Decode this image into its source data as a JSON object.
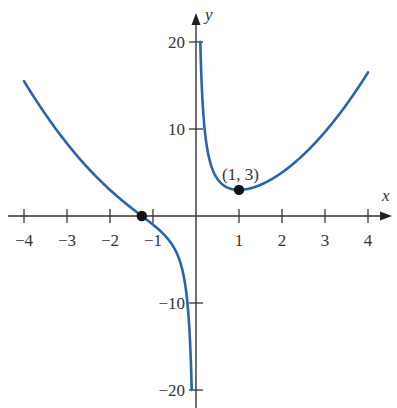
{
  "chart_data": {
    "type": "line",
    "title": "",
    "xlabel": "x",
    "ylabel": "y",
    "xlim": [
      -4,
      4
    ],
    "ylim": [
      -20,
      20
    ],
    "grid": false,
    "x_ticks": [
      -4,
      -3,
      -2,
      -1,
      1,
      2,
      3,
      4
    ],
    "x_tick_labels": [
      "−4",
      "−3",
      "−2",
      "−1",
      "1",
      "2",
      "3",
      "4"
    ],
    "y_ticks": [
      20,
      10,
      -10,
      -20
    ],
    "y_tick_labels": [
      "20",
      "10",
      "−10",
      "−20"
    ],
    "series": [
      {
        "name": "y = x^2 + 2/x",
        "color": "#2a63ad",
        "branches": [
          {
            "x": [
              -4,
              -3,
              -2,
              -1.26,
              -1,
              -0.5,
              -0.2,
              -0.1
            ],
            "y": [
              15.5,
              8.33,
              3,
              0,
              -1,
              -3.75,
              -9.96,
              -19.99
            ]
          },
          {
            "x": [
              0.1,
              0.2,
              0.5,
              1,
              2,
              3,
              4
            ],
            "y": [
              20.01,
              10.04,
              4.25,
              3,
              5,
              9.67,
              16.5
            ]
          }
        ]
      }
    ],
    "points": [
      {
        "x": 1,
        "y": 3,
        "label": "(1, 3)"
      },
      {
        "x": -1.26,
        "y": 0,
        "label": ""
      }
    ],
    "annotations": [
      "(1, 3)"
    ]
  },
  "labels": {
    "x_axis": "x",
    "y_axis": "y",
    "min_point": "(1, 3)"
  }
}
